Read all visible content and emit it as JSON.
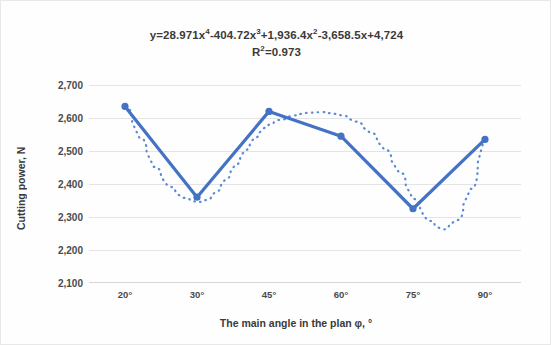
{
  "chart_data": {
    "type": "line",
    "subtitle": "R²=0.973",
    "equation_parts": {
      "prefix": "y=28.971x",
      "exp1": "4",
      "term2": "-404.72x",
      "exp2": "3",
      "term3": "+1,936.4x",
      "exp3": "2",
      "term4": "-3,658.5x+4,724",
      "r_label": "R",
      "r_exp": "2",
      "r_value": "=0.973"
    },
    "xlabel": "The main angle in the plan φ, °",
    "ylabel": "Cutting power, N",
    "categories": [
      "20°",
      "30°",
      "45°",
      "60°",
      "75°",
      "90°"
    ],
    "x_numeric": [
      20,
      30,
      45,
      60,
      75,
      90
    ],
    "ylim": [
      2100,
      2700
    ],
    "y_ticks": [
      "2,100",
      "2,200",
      "2,300",
      "2,400",
      "2,500",
      "2,600",
      "2,700"
    ],
    "y_tick_values": [
      2100,
      2200,
      2300,
      2400,
      2500,
      2600,
      2700
    ],
    "grid": true,
    "legend": "none",
    "series": [
      {
        "name": "Cutting power",
        "style": "line-with-markers",
        "color": "#4472C4",
        "values": [
          2635,
          2360,
          2620,
          2545,
          2325,
          2535
        ]
      },
      {
        "name": "Polynomial trendline (order 4)",
        "style": "dotted",
        "color": "#5B8AD6",
        "values": [
          2630,
          2345,
          2560,
          2610,
          2285,
          2540
        ]
      }
    ],
    "trendline_curve": [
      [
        20,
        2633
      ],
      [
        22,
        2540
      ],
      [
        24,
        2452
      ],
      [
        26,
        2392
      ],
      [
        28,
        2358
      ],
      [
        30,
        2345
      ],
      [
        32,
        2352
      ],
      [
        34,
        2378
      ],
      [
        36,
        2416
      ],
      [
        38,
        2459
      ],
      [
        40,
        2503
      ],
      [
        42,
        2541
      ],
      [
        44,
        2570
      ],
      [
        45,
        2580
      ],
      [
        47,
        2594
      ],
      [
        50,
        2608
      ],
      [
        53,
        2616
      ],
      [
        56,
        2618
      ],
      [
        59,
        2612
      ],
      [
        60,
        2608
      ],
      [
        63,
        2589
      ],
      [
        66,
        2556
      ],
      [
        69,
        2505
      ],
      [
        72,
        2437
      ],
      [
        75,
        2355
      ],
      [
        78,
        2289
      ],
      [
        81,
        2262
      ],
      [
        84,
        2290
      ],
      [
        87,
        2385
      ],
      [
        90,
        2545
      ]
    ],
    "colors": {
      "accent": "#4472C4",
      "trendline": "#5B8AD6",
      "grid": "#E4E4E4",
      "text": "#3A3A3A",
      "background": "#FEFEFE"
    }
  }
}
